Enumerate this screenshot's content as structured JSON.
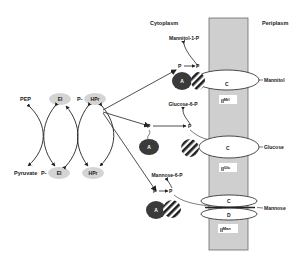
{
  "regions": {
    "cytoplasm": "Cytoplasm",
    "periplasm": "Periplasm"
  },
  "general": {
    "pep": "PEP",
    "pyruvate": "Pyruvate",
    "ei_top": "EI",
    "ei_bottom": "EI",
    "hpr_top": "HPr",
    "hpr_bottom": "HPr",
    "p_prefix_top": "P-",
    "p_prefix_bottom": "P-"
  },
  "systems": [
    {
      "name": "mannitol",
      "product": "Mannitol-1-P",
      "substrate": "Mannitol",
      "domain_a": "A",
      "domain_b": "B",
      "domain_c": "C",
      "p_left": "P",
      "p_right": "P",
      "enzyme_base": "II",
      "enzyme_sup": "Mtl"
    },
    {
      "name": "glucose",
      "product": "Glucose-6-P",
      "substrate": "Glucose",
      "domain_a": "A",
      "domain_b": "B",
      "domain_c": "C",
      "p_left": "P",
      "p_right": "P",
      "enzyme_base": "II",
      "enzyme_sup": "Glc"
    },
    {
      "name": "mannose",
      "product": "Mannose-6-P",
      "substrate": "Mannose",
      "domain_a": "A",
      "domain_b": "B",
      "domain_c": "C",
      "domain_d": "D",
      "p_left": "P",
      "p_right": "P",
      "enzyme_base": "II",
      "enzyme_sup": "Man"
    }
  ],
  "colors": {
    "membrane_fill": "#cfcfcf",
    "membrane_border": "#6a6a6a",
    "general_protein_fill": "#d4d4d4",
    "domain_a_fill": "#3a3a3a",
    "line": "#222222"
  }
}
